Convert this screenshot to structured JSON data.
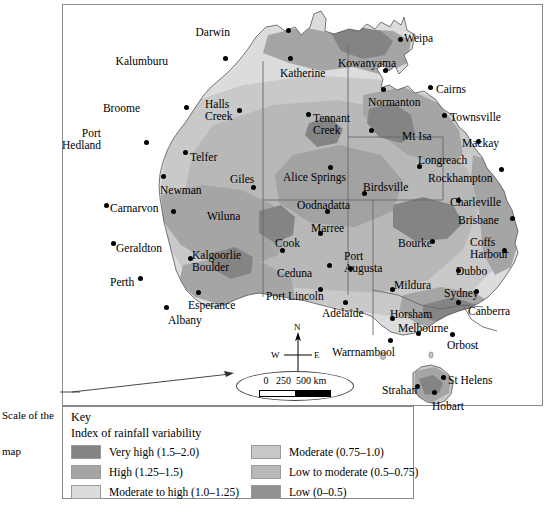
{
  "map": {
    "title": "Index of rainfall variability map of Australia",
    "annotation": {
      "line1": "Scale of the",
      "line2": "map"
    },
    "compass": {
      "north": "N",
      "south": "S",
      "east": "E",
      "west": "W"
    },
    "scale_bar": {
      "zero": "0",
      "mid": "250",
      "max": "500 km",
      "full_text": "0   250  500 km"
    },
    "cities": [
      {
        "name": "Darwin",
        "label_x": 230,
        "label_y": 27,
        "dot_x": 288,
        "dot_y": 30,
        "align": "right"
      },
      {
        "name": "Weipa",
        "label_x": 404,
        "label_y": 33,
        "dot_x": 400,
        "dot_y": 39,
        "align": "left"
      },
      {
        "name": "Kalumburu",
        "label_x": 168,
        "label_y": 56,
        "dot_x": 225,
        "dot_y": 58,
        "align": "right"
      },
      {
        "name": "Katherine",
        "label_x": 280,
        "label_y": 68,
        "dot_x": 290,
        "dot_y": 58,
        "align": "left"
      },
      {
        "name": "Kowanyama",
        "label_x": 338,
        "label_y": 58,
        "dot_x": 385,
        "dot_y": 70,
        "align": "left"
      },
      {
        "name": "Cairns",
        "label_x": 436,
        "label_y": 84,
        "dot_x": 430,
        "dot_y": 87,
        "align": "left"
      },
      {
        "name": "Normanton",
        "label_x": 368,
        "label_y": 97,
        "dot_x": 383,
        "dot_y": 89,
        "align": "left"
      },
      {
        "name": "Townsville",
        "label_x": 450,
        "label_y": 112,
        "dot_x": 444,
        "dot_y": 115,
        "align": "left"
      },
      {
        "name": "Broome",
        "label_x": 140,
        "label_y": 103,
        "dot_x": 186,
        "dot_y": 107,
        "align": "right"
      },
      {
        "name": "Halls Creek",
        "label_x": 205,
        "label_y": 98,
        "dot_x": 239,
        "dot_y": 110,
        "align": "left",
        "multiline": true
      },
      {
        "name": "Tennant Creek",
        "label_x": 313,
        "label_y": 112,
        "dot_x": 308,
        "dot_y": 114,
        "align": "left",
        "multiline": true
      },
      {
        "name": "Mt Isa",
        "label_x": 402,
        "label_y": 131,
        "dot_x": 371,
        "dot_y": 130,
        "align": "left"
      },
      {
        "name": "Mackay",
        "label_x": 462,
        "label_y": 138,
        "dot_x": 478,
        "dot_y": 141,
        "align": "left"
      },
      {
        "name": "Port Hedland",
        "label_x": 101,
        "label_y": 127,
        "dot_x": 146,
        "dot_y": 142,
        "align": "right",
        "multiline": true
      },
      {
        "name": "Telfer",
        "label_x": 190,
        "label_y": 152,
        "dot_x": 185,
        "dot_y": 152,
        "align": "left"
      },
      {
        "name": "Giles",
        "label_x": 230,
        "label_y": 174,
        "dot_x": 253,
        "dot_y": 187,
        "align": "left"
      },
      {
        "name": "Alice Springs",
        "label_x": 283,
        "label_y": 172,
        "dot_x": 330,
        "dot_y": 167,
        "align": "left"
      },
      {
        "name": "Longreach",
        "label_x": 418,
        "label_y": 155,
        "dot_x": 419,
        "dot_y": 166,
        "align": "left"
      },
      {
        "name": "Rockhampton",
        "label_x": 428,
        "label_y": 173,
        "dot_x": 501,
        "dot_y": 169,
        "align": "left"
      },
      {
        "name": "Birdsville",
        "label_x": 363,
        "label_y": 182,
        "dot_x": 364,
        "dot_y": 193,
        "align": "left"
      },
      {
        "name": "Newman",
        "label_x": 160,
        "label_y": 185,
        "dot_x": 163,
        "dot_y": 176,
        "align": "left"
      },
      {
        "name": "Carnarvon",
        "label_x": 110,
        "label_y": 203,
        "dot_x": 106,
        "dot_y": 205,
        "align": "left"
      },
      {
        "name": "Wiluna",
        "label_x": 207,
        "label_y": 211,
        "dot_x": 173,
        "dot_y": 211,
        "align": "left"
      },
      {
        "name": "Oodnadatta",
        "label_x": 297,
        "label_y": 200,
        "dot_x": 327,
        "dot_y": 211,
        "align": "left"
      },
      {
        "name": "Charleville",
        "label_x": 450,
        "label_y": 197,
        "dot_x": 458,
        "dot_y": 200,
        "align": "left"
      },
      {
        "name": "Brisbane",
        "label_x": 458,
        "label_y": 215,
        "dot_x": 512,
        "dot_y": 218,
        "align": "left"
      },
      {
        "name": "Marree",
        "label_x": 311,
        "label_y": 223,
        "dot_x": 320,
        "dot_y": 233,
        "align": "left"
      },
      {
        "name": "Bourke",
        "label_x": 398,
        "label_y": 238,
        "dot_x": 432,
        "dot_y": 241,
        "align": "left"
      },
      {
        "name": "Coffs Harbour",
        "label_x": 470,
        "label_y": 236,
        "dot_x": 504,
        "dot_y": 250,
        "align": "left",
        "multiline": true
      },
      {
        "name": "Geraldton",
        "label_x": 116,
        "label_y": 243,
        "dot_x": 113,
        "dot_y": 243,
        "align": "left"
      },
      {
        "name": "Kalgoorlie Boulder",
        "label_x": 192,
        "label_y": 249,
        "dot_x": 190,
        "dot_y": 258,
        "align": "left",
        "multiline": true
      },
      {
        "name": "Cook",
        "label_x": 275,
        "label_y": 238,
        "dot_x": 282,
        "dot_y": 250,
        "align": "left"
      },
      {
        "name": "Ceduna",
        "label_x": 277,
        "label_y": 268,
        "dot_x": 329,
        "dot_y": 265,
        "align": "left"
      },
      {
        "name": "Port Augusta",
        "label_x": 344,
        "label_y": 250,
        "dot_x": 350,
        "dot_y": 268,
        "align": "left",
        "multiline": true
      },
      {
        "name": "Dubbo",
        "label_x": 456,
        "label_y": 266,
        "dot_x": 458,
        "dot_y": 270,
        "align": "left"
      },
      {
        "name": "Perth",
        "label_x": 110,
        "label_y": 277,
        "dot_x": 140,
        "dot_y": 278,
        "align": "left"
      },
      {
        "name": "Mildura",
        "label_x": 394,
        "label_y": 280,
        "dot_x": 392,
        "dot_y": 289,
        "align": "left"
      },
      {
        "name": "Sydney",
        "label_x": 444,
        "label_y": 288,
        "dot_x": 476,
        "dot_y": 291,
        "align": "left"
      },
      {
        "name": "Canberra",
        "label_x": 468,
        "label_y": 306,
        "dot_x": 458,
        "dot_y": 302,
        "align": "left"
      },
      {
        "name": "Esperance",
        "label_x": 188,
        "label_y": 300,
        "dot_x": 198,
        "dot_y": 292,
        "align": "left"
      },
      {
        "name": "Port Lincoln",
        "label_x": 266,
        "label_y": 291,
        "dot_x": 320,
        "dot_y": 289,
        "align": "left"
      },
      {
        "name": "Adelaide",
        "label_x": 322,
        "label_y": 308,
        "dot_x": 345,
        "dot_y": 302,
        "align": "left"
      },
      {
        "name": "Horsham",
        "label_x": 390,
        "label_y": 309,
        "dot_x": 392,
        "dot_y": 318,
        "align": "left"
      },
      {
        "name": "Albany",
        "label_x": 168,
        "label_y": 315,
        "dot_x": 166,
        "dot_y": 307,
        "align": "left"
      },
      {
        "name": "Melbourne",
        "label_x": 398,
        "label_y": 323,
        "dot_x": 418,
        "dot_y": 333,
        "align": "left"
      },
      {
        "name": "Orbost",
        "label_x": 447,
        "label_y": 340,
        "dot_x": 452,
        "dot_y": 334,
        "align": "left"
      },
      {
        "name": "Warrnambool",
        "label_x": 332,
        "label_y": 347,
        "dot_x": 390,
        "dot_y": 340,
        "align": "left"
      },
      {
        "name": "St Helens",
        "label_x": 448,
        "label_y": 375,
        "dot_x": 443,
        "dot_y": 377,
        "align": "left"
      },
      {
        "name": "Strahan",
        "label_x": 382,
        "label_y": 385,
        "dot_x": 417,
        "dot_y": 386,
        "align": "left"
      },
      {
        "name": "Hobart",
        "label_x": 432,
        "label_y": 401,
        "dot_x": 434,
        "dot_y": 392,
        "align": "left"
      }
    ]
  },
  "key": {
    "title": "Key",
    "subtitle": "Index of rainfall variability",
    "column1": [
      {
        "label": "Very high (1.5–2.0)",
        "color": "#848484"
      },
      {
        "label": "High (1.25–1.5)",
        "color": "#a5a5a5"
      },
      {
        "label": "Moderate to high (1.0–1.25)",
        "color": "#dcdcdc"
      }
    ],
    "column2": [
      {
        "label": "Moderate (0.75–1.0)",
        "color": "#c9c9c9"
      },
      {
        "label": "Low to moderate (0.5–0.75)",
        "color": "#b8b8b8"
      },
      {
        "label": "Low (0–0.5)",
        "color": "#909090"
      }
    ]
  },
  "colors": {
    "very_high": "#848484",
    "high": "#a5a5a5",
    "moderate_to_high": "#dcdcdc",
    "moderate": "#c9c9c9",
    "low_to_moderate": "#b8b8b8",
    "low": "#909090",
    "frame": "#8a8a8a",
    "text": "#000000"
  }
}
